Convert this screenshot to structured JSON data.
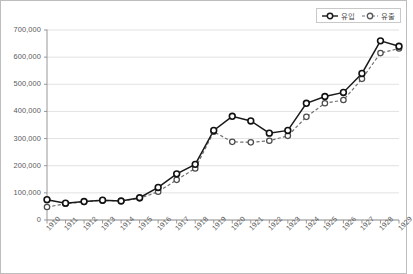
{
  "chart_data": {
    "type": "line",
    "title": "",
    "xlabel": "",
    "ylabel": "",
    "ylim": [
      0,
      700000
    ],
    "ytick_step": 100000,
    "grid": true,
    "legend_position": "top-right",
    "categories": [
      "1910",
      "1911",
      "1912",
      "1913",
      "1914",
      "1915",
      "1916",
      "1917",
      "1918",
      "1919",
      "1920",
      "1921",
      "1922",
      "1923",
      "1924",
      "1925",
      "1926",
      "1927",
      "1928",
      "1929"
    ],
    "series": [
      {
        "name": "유입",
        "style": "solid",
        "color": "#1a1a1a",
        "marker": "circle-open",
        "values": [
          75000,
          62000,
          68000,
          73000,
          70000,
          82000,
          120000,
          170000,
          205000,
          330000,
          382000,
          365000,
          320000,
          330000,
          430000,
          455000,
          470000,
          540000,
          660000,
          640000
        ]
      },
      {
        "name": "유출",
        "style": "dashed",
        "color": "#707070",
        "marker": "circle-open",
        "values": [
          48000,
          60000,
          67000,
          72000,
          70000,
          80000,
          104000,
          148000,
          190000,
          325000,
          288000,
          286000,
          292000,
          310000,
          380000,
          430000,
          442000,
          520000,
          615000,
          632000
        ]
      }
    ],
    "ytick_labels": [
      "0",
      "100,000",
      "200,000",
      "300,000",
      "400,000",
      "500,000",
      "600,000",
      "700,000"
    ]
  }
}
